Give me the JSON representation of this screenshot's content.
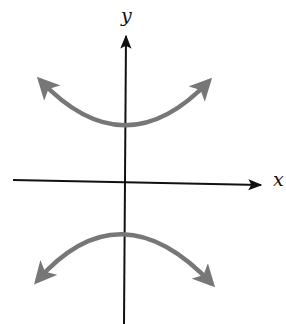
{
  "diagram": {
    "type": "hyperbola-sketch",
    "axes": {
      "x_label": "x",
      "y_label": "y",
      "axis_color": "#111111"
    },
    "curves": [
      {
        "name": "upper-branch",
        "opens": "up",
        "vertex": [
          125,
          128
        ],
        "left_end": [
          37,
          76
        ],
        "right_end": [
          212,
          78
        ],
        "color": "#777777"
      },
      {
        "name": "lower-branch",
        "opens": "down",
        "vertex": [
          123,
          228
        ],
        "left_end": [
          33,
          284
        ],
        "right_end": [
          215,
          287
        ],
        "color": "#777777"
      }
    ]
  }
}
